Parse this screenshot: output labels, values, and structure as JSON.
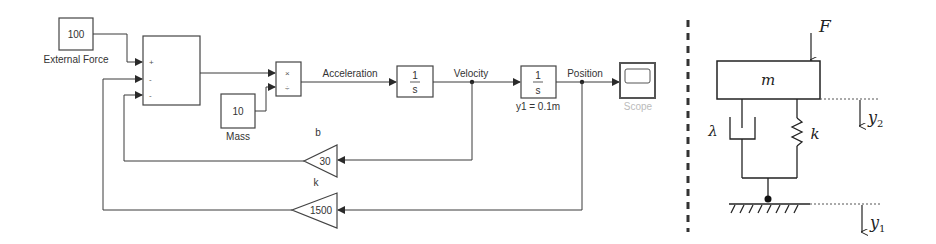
{
  "simulink": {
    "external_force": {
      "value": "100",
      "label": "External Force"
    },
    "sum": {
      "ports": [
        "+",
        "-",
        "-"
      ]
    },
    "product": {
      "ports": [
        "×",
        "÷"
      ]
    },
    "mass": {
      "value": "10",
      "label": "Mass"
    },
    "signals": {
      "acceleration": "Acceleration",
      "velocity": "Velocity",
      "position": "Position"
    },
    "integrator1": {
      "num": "1",
      "den": "s"
    },
    "integrator2": {
      "num": "1",
      "den": "s",
      "initial_condition": "y1 = 0.1m"
    },
    "scope": {
      "label": "Scope"
    },
    "gain_b": {
      "name": "b",
      "value": "30"
    },
    "gain_k": {
      "name": "k",
      "value": "1500"
    }
  },
  "mechanical": {
    "force": "F",
    "mass": "m",
    "damper": "λ",
    "spring": "k",
    "y2": {
      "base": "y",
      "sub": "2"
    },
    "y1": {
      "base": "y",
      "sub": "1"
    }
  },
  "colors": {
    "line": "#3a3a3a",
    "text": "#333333",
    "scope_label": "#bbbbbb",
    "divider": "#333333"
  }
}
